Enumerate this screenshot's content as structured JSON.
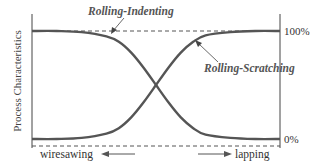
{
  "chart_data": {
    "type": "line",
    "title": "",
    "ylabel": "Process Characteristics",
    "xlabel": "",
    "x_direction_labels": {
      "left": "wiresawing",
      "right": "lapping"
    },
    "y_ticks": [
      {
        "label": "0%",
        "value": 0
      },
      {
        "label": "100%",
        "value": 100
      }
    ],
    "ylim": [
      0,
      100
    ],
    "xlim": [
      0,
      1
    ],
    "grid": false,
    "reference_lines": [
      {
        "name": "upper-dashed",
        "y": 100,
        "style": "dashed"
      },
      {
        "name": "lower-dashed",
        "y": -6,
        "style": "dashed"
      }
    ],
    "series": [
      {
        "name": "Rolling-Indenting",
        "trend": "decreasing-sigmoid",
        "x": [
          0,
          0.1,
          0.2,
          0.3,
          0.35,
          0.4,
          0.45,
          0.5,
          0.55,
          0.6,
          0.65,
          0.7,
          0.8,
          0.9,
          1.0
        ],
        "values": [
          100,
          100,
          99,
          95,
          90,
          80,
          66,
          50,
          34,
          20,
          10,
          4,
          1,
          0,
          0
        ]
      },
      {
        "name": "Rolling-Scratching",
        "trend": "increasing-sigmoid",
        "x": [
          0,
          0.1,
          0.2,
          0.3,
          0.35,
          0.4,
          0.45,
          0.5,
          0.55,
          0.6,
          0.65,
          0.7,
          0.8,
          0.9,
          1.0
        ],
        "values": [
          0,
          0,
          1,
          5,
          10,
          20,
          34,
          50,
          66,
          80,
          90,
          96,
          99,
          100,
          100
        ]
      }
    ],
    "annotations": [
      {
        "text": "Rolling-Indenting",
        "points_to_series": "Rolling-Indenting"
      },
      {
        "text": "Rolling-Scratching",
        "points_to_series": "Rolling-Scratching"
      }
    ]
  },
  "colors": {
    "curve": "#555555",
    "axis": "#444444",
    "label": "#555555"
  }
}
